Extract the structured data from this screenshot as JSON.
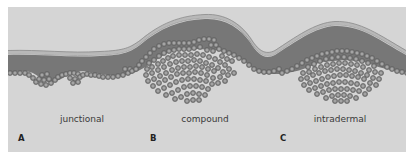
{
  "figure": {
    "type": "histology schematic",
    "panels": [
      {
        "letter": "A",
        "label": "junctional"
      },
      {
        "letter": "B",
        "label": "compound"
      },
      {
        "letter": "C",
        "label": "intradermal"
      }
    ]
  },
  "colors": {
    "background": "#d5d5d5",
    "epidermis": "#777777",
    "stratum_corneum": "#b9b9b9",
    "surface_line": "#8a8a8a",
    "cell_fill": "#8c8c8c",
    "cell_stroke": "#5e5e5e",
    "cell_nucleus": "#a8a8a8"
  }
}
